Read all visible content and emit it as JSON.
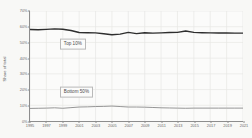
{
  "chart_data": {
    "type": "line",
    "title": "",
    "subtitle": "",
    "xlabel": "",
    "ylabel": "Share of total",
    "xlim": [
      1995,
      2021
    ],
    "ylim": [
      0,
      70
    ],
    "grid": true,
    "legend_position": "inline-callout",
    "y_tick_labels": [
      "70%",
      "60%",
      "50%",
      "40%",
      "30%",
      "20%",
      "10%",
      "0%"
    ],
    "y_tick_values": [
      70,
      60,
      50,
      40,
      30,
      20,
      10,
      0
    ],
    "x_tick_labels": [
      "1995",
      "1997",
      "1999",
      "2001",
      "2003",
      "2005",
      "2007",
      "2009",
      "2011",
      "2013",
      "2015",
      "2017",
      "2019",
      "2021"
    ],
    "x_tick_values": [
      1995,
      1997,
      1999,
      2001,
      2003,
      2005,
      2007,
      2009,
      2011,
      2013,
      2015,
      2017,
      2019,
      2021
    ],
    "x": [
      1995,
      1996,
      1997,
      1998,
      1999,
      2000,
      2001,
      2002,
      2003,
      2004,
      2005,
      2006,
      2007,
      2008,
      2009,
      2010,
      2011,
      2012,
      2013,
      2014,
      2015,
      2016,
      2017,
      2018,
      2019,
      2020,
      2021
    ],
    "series": [
      {
        "name": "Top 10%",
        "color": "#2e2e2e",
        "width": 1.4,
        "values": [
          58.2,
          58.1,
          58.3,
          58.6,
          58.4,
          57.6,
          56.3,
          56.2,
          56.1,
          55.5,
          54.9,
          55.3,
          56.4,
          55.6,
          56.2,
          55.9,
          56.1,
          56.3,
          56.4,
          57.3,
          56.4,
          56.2,
          56.1,
          56.0,
          56.0,
          55.9,
          55.9
        ]
      },
      {
        "name": "Bottom 50%",
        "color": "#8a8a8a",
        "width": 0.9,
        "values": [
          8.0,
          8.1,
          8.2,
          8.4,
          8.1,
          8.5,
          8.9,
          9.0,
          9.2,
          9.3,
          9.5,
          9.2,
          8.9,
          8.9,
          8.8,
          8.6,
          8.4,
          8.3,
          8.2,
          8.1,
          8.2,
          8.2,
          8.2,
          8.2,
          8.2,
          8.2,
          8.2
        ]
      }
    ],
    "annotations": [
      {
        "text": "Top 10%",
        "x": 1998.6,
        "y": 49.0
      },
      {
        "text": "Bottom 50%",
        "x": 1998.6,
        "y": 19.0
      }
    ],
    "colors": {
      "plot_background": "#fbfbfa",
      "page_background": "#f8f8f6",
      "axis": "#8d8d8d",
      "grid": "#e6e6e4",
      "tick_text": "#6a6a6a",
      "callout_border": "#b9b9b9",
      "callout_text": "#4a4a4a"
    }
  }
}
